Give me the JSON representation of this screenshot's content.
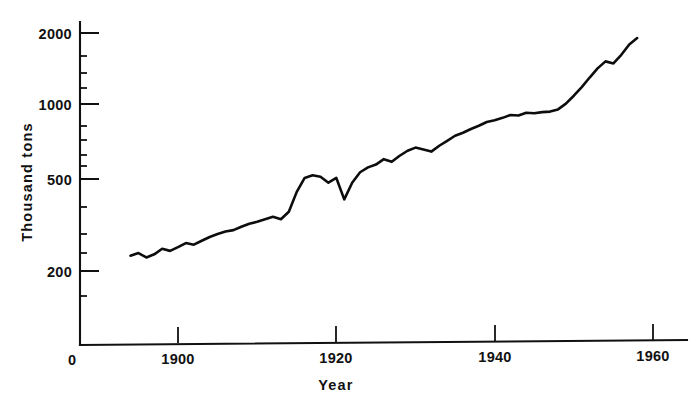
{
  "figure": {
    "background_color": "#ffffff",
    "line_color": "#0d0d0d",
    "text_color": "#111111"
  },
  "labels": {
    "ylabel": "Thousand  tons",
    "xlabel": "Year",
    "origin": "0",
    "ytick_2000": "2000",
    "ytick_1000": "1000",
    "ytick_500": "500",
    "ytick_200": "200",
    "xtick_1900": "1900",
    "xtick_1920": "1920",
    "xtick_1940": "1940",
    "xtick_1960": "1960"
  },
  "chart_data": {
    "type": "line",
    "title": "",
    "subtitle": "",
    "xlabel": "Year",
    "ylabel": "Thousand  tons",
    "yscale": "log",
    "xscale": "linear",
    "grid": false,
    "legend": "none",
    "xlim": [
      1890,
      1962
    ],
    "ylim": [
      150,
      2400
    ],
    "xticks": [
      1900,
      1920,
      1940,
      1960
    ],
    "xtick_labels": [
      "1900",
      "1920",
      "1940",
      "1960"
    ],
    "yticks": [
      200,
      500,
      1000,
      2000
    ],
    "ytick_labels": [
      "200",
      "500",
      "1000",
      "2000"
    ],
    "y_minor_ticks": [
      150,
      250,
      300,
      400,
      600,
      700,
      800,
      900,
      1200,
      1400,
      1600,
      1800
    ],
    "origin_label": "0",
    "annotations": [],
    "series": [
      {
        "name": "Production",
        "x": [
          1894,
          1895,
          1896,
          1897,
          1898,
          1899,
          1900,
          1901,
          1902,
          1903,
          1904,
          1905,
          1906,
          1907,
          1908,
          1909,
          1910,
          1911,
          1912,
          1913,
          1914,
          1915,
          1916,
          1917,
          1918,
          1919,
          1920,
          1921,
          1922,
          1923,
          1924,
          1925,
          1926,
          1927,
          1928,
          1929,
          1930,
          1931,
          1932,
          1933,
          1934,
          1935,
          1936,
          1937,
          1938,
          1939,
          1940,
          1941,
          1942,
          1943,
          1944,
          1945,
          1946,
          1947,
          1948,
          1949,
          1950,
          1951,
          1952,
          1953,
          1954,
          1955,
          1956,
          1957,
          1958
        ],
        "y": [
          232,
          238,
          228,
          235,
          248,
          243,
          252,
          262,
          258,
          268,
          278,
          286,
          293,
          297,
          307,
          316,
          322,
          330,
          338,
          330,
          355,
          430,
          492,
          505,
          498,
          470,
          492,
          400,
          470,
          520,
          545,
          560,
          590,
          575,
          610,
          640,
          660,
          648,
          635,
          672,
          705,
          740,
          762,
          790,
          815,
          845,
          860,
          880,
          905,
          900,
          925,
          920,
          930,
          935,
          955,
          1010,
          1090,
          1185,
          1300,
          1420,
          1520,
          1490,
          1620,
          1790,
          1905
        ]
      }
    ]
  }
}
